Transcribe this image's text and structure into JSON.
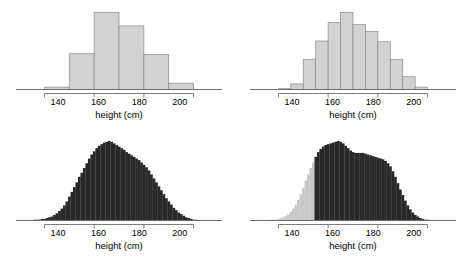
{
  "figure": {
    "background": "#ffffff",
    "panel_count": 4,
    "fill_light": "#d2d2d2",
    "fill_dark": "#282828",
    "stroke": "#8a8a8a",
    "axis_color": "#6e6e6e",
    "text_color": "#000000"
  },
  "axis": {
    "xlabel": "height (cm)",
    "ticks": [
      {
        "value": 140,
        "label": "140"
      },
      {
        "value": 160,
        "label": "160"
      },
      {
        "value": 180,
        "label": "180"
      },
      {
        "value": 200,
        "label": "200"
      }
    ],
    "xlim": [
      133,
      207
    ]
  },
  "chart_data": [
    {
      "type": "bar",
      "id": "top-left",
      "title": "",
      "xlabel": "height (cm)",
      "ylabel": "",
      "binwidth": 10,
      "fill": "#d2d2d2",
      "grid": false,
      "xlim": [
        133,
        207
      ],
      "ylim": [
        0,
        100
      ],
      "bin_edges": [
        140,
        150,
        160,
        170,
        180,
        190,
        200
      ],
      "categories": [
        "140-150",
        "150-160",
        "160-170",
        "170-180",
        "180-190",
        "190-200"
      ],
      "values": [
        3,
        45,
        97,
        80,
        44,
        8
      ]
    },
    {
      "type": "bar",
      "id": "top-right",
      "title": "",
      "xlabel": "height (cm)",
      "ylabel": "",
      "binwidth": 5,
      "fill": "#d2d2d2",
      "grid": false,
      "xlim": [
        133,
        207
      ],
      "ylim": [
        0,
        100
      ],
      "bin_edges": [
        140,
        145,
        150,
        155,
        160,
        165,
        170,
        175,
        180,
        185,
        190,
        195,
        200
      ],
      "categories": [
        "140-145",
        "145-150",
        "150-155",
        "155-160",
        "160-165",
        "165-170",
        "170-175",
        "175-180",
        "180-185",
        "185-190",
        "190-195",
        "195-200"
      ],
      "values": [
        1,
        7,
        38,
        61,
        84,
        97,
        82,
        73,
        60,
        38,
        16,
        3
      ]
    },
    {
      "type": "bar",
      "id": "bottom-left",
      "title": "",
      "xlabel": "height (cm)",
      "ylabel": "",
      "binwidth": 1,
      "fill": "#282828",
      "grid": false,
      "xlim": [
        133,
        207
      ],
      "ylim": [
        0,
        100
      ],
      "x": [
        134,
        135,
        136,
        137,
        138,
        139,
        140,
        141,
        142,
        143,
        144,
        145,
        146,
        147,
        148,
        149,
        150,
        151,
        152,
        153,
        154,
        155,
        156,
        157,
        158,
        159,
        160,
        161,
        162,
        163,
        164,
        165,
        166,
        167,
        168,
        169,
        170,
        171,
        172,
        173,
        174,
        175,
        176,
        177,
        178,
        179,
        180,
        181,
        182,
        183,
        184,
        185,
        186,
        187,
        188,
        189,
        190,
        191,
        192,
        193,
        194,
        195,
        196,
        197,
        198,
        199,
        200,
        201,
        202,
        203
      ],
      "values": [
        0,
        0,
        1,
        1,
        1,
        2,
        2,
        3,
        4,
        5,
        7,
        9,
        12,
        15,
        19,
        24,
        30,
        36,
        42,
        48,
        55,
        60,
        66,
        72,
        78,
        83,
        87,
        91,
        94,
        96,
        98,
        99,
        100,
        99,
        97,
        95,
        93,
        91,
        89,
        86,
        84,
        82,
        80,
        78,
        76,
        73,
        70,
        67,
        63,
        58,
        53,
        48,
        43,
        38,
        33,
        28,
        24,
        20,
        16,
        13,
        10,
        8,
        6,
        4,
        3,
        2,
        1,
        1,
        0,
        0
      ]
    },
    {
      "type": "bar",
      "id": "bottom-right",
      "title": "",
      "xlabel": "height (cm)",
      "ylabel": "",
      "binwidth": 1,
      "fill": "#282828",
      "fill_secondary": "#c8c8c8",
      "split_at": 155,
      "grid": false,
      "xlim": [
        133,
        207
      ],
      "ylim": [
        0,
        100
      ],
      "x": [
        134,
        135,
        136,
        137,
        138,
        139,
        140,
        141,
        142,
        143,
        144,
        145,
        146,
        147,
        148,
        149,
        150,
        151,
        152,
        153,
        154,
        155,
        156,
        157,
        158,
        159,
        160,
        161,
        162,
        163,
        164,
        165,
        166,
        167,
        168,
        169,
        170,
        171,
        172,
        173,
        174,
        175,
        176,
        177,
        178,
        179,
        180,
        181,
        182,
        183,
        184,
        185,
        186,
        187,
        188,
        189,
        190,
        191,
        192,
        193,
        194,
        195,
        196,
        197,
        198,
        199,
        200,
        201,
        202,
        203
      ],
      "values": [
        0,
        0,
        0,
        1,
        1,
        1,
        2,
        3,
        4,
        6,
        8,
        11,
        15,
        20,
        26,
        33,
        41,
        50,
        58,
        66,
        73,
        80,
        86,
        90,
        93,
        95,
        96,
        97,
        98,
        99,
        100,
        99,
        97,
        94,
        91,
        88,
        86,
        85,
        85,
        85,
        85,
        84,
        83,
        82,
        81,
        80,
        79,
        78,
        77,
        75,
        72,
        68,
        62,
        55,
        47,
        39,
        32,
        25,
        19,
        14,
        10,
        7,
        5,
        3,
        2,
        1,
        1,
        0,
        0,
        0
      ]
    }
  ]
}
